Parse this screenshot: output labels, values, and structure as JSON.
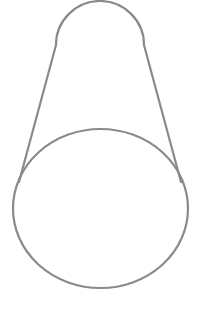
{
  "figure": {
    "stroke_color": "#8a8a8a",
    "background": "#ffffff",
    "stroke_width": 2.2,
    "top_arc": {
      "cx": 100,
      "cy": 52,
      "r": 44,
      "start": [
        56,
        45
      ],
      "end": [
        144,
        45
      ]
    },
    "left_line": {
      "x1": 56,
      "y1": 45,
      "x2": 19,
      "y2": 182
    },
    "right_line": {
      "x1": 144,
      "y1": 45,
      "x2": 181,
      "y2": 182
    },
    "ellipse": {
      "cx": 100.5,
      "cy": 208.5,
      "rx": 87.5,
      "ry": 79.5
    }
  }
}
